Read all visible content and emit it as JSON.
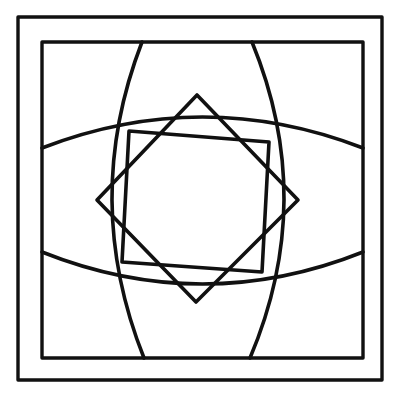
{
  "canvas": {
    "width": 398,
    "height": 400,
    "background_color": "#ffffff",
    "stroke_color": "#111111",
    "title": "Symmetric geometric line drawing"
  },
  "figure": {
    "center": {
      "x": 198,
      "y": 200
    }
  },
  "frames": [
    {
      "name": "outer-frame",
      "left": 18,
      "top": 17,
      "right": 382,
      "bottom": 380,
      "stroke_width": 3.4
    },
    {
      "name": "inner-frame",
      "left": 42,
      "top": 42,
      "right": 363,
      "bottom": 358,
      "stroke_width": 3.4
    }
  ],
  "shapes": {
    "diamond": {
      "name": "diamond-square",
      "stroke_width": 3.6,
      "points": [
        {
          "label": "top",
          "x": 197,
          "y": 95
        },
        {
          "label": "right",
          "x": 298,
          "y": 200
        },
        {
          "label": "bottom",
          "x": 196,
          "y": 302
        },
        {
          "label": "left",
          "x": 97,
          "y": 200
        }
      ]
    },
    "tilted_square": {
      "name": "tilted-square",
      "stroke_width": 3.6,
      "points": [
        {
          "label": "top-left",
          "x": 129,
          "y": 131
        },
        {
          "label": "top-right",
          "x": 269,
          "y": 142
        },
        {
          "label": "bottom-right",
          "x": 262,
          "y": 272
        },
        {
          "label": "bottom-left",
          "x": 122,
          "y": 262
        }
      ]
    },
    "vertical_lens": {
      "name": "vertical-lens",
      "stroke_width": 3.6,
      "top_y": 42,
      "bottom_y": 358,
      "left_arc": {
        "top_x": 142,
        "bottom_x": 144,
        "bulge_x": 112
      },
      "right_arc": {
        "top_x": 252,
        "bottom_x": 250,
        "bulge_x": 284
      }
    },
    "horizontal_lens": {
      "name": "horizontal-lens",
      "stroke_width": 3.6,
      "left_x": 42,
      "right_x": 363,
      "top_arc": {
        "left_y": 148,
        "right_y": 148,
        "bulge_y": 117
      },
      "bottom_arc": {
        "left_y": 252,
        "right_y": 252,
        "bulge_y": 284
      }
    }
  }
}
